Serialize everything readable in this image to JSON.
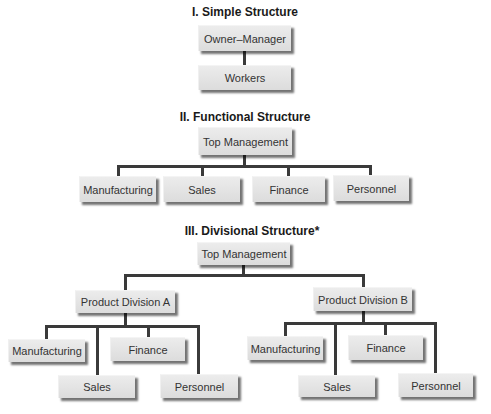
{
  "simple": {
    "title": "I. Simple Structure",
    "top": "Owner–Manager",
    "bottom": "Workers"
  },
  "functional": {
    "title": "II. Functional Structure",
    "top": "Top Management",
    "children": [
      "Manufacturing",
      "Sales",
      "Finance",
      "Personnel"
    ]
  },
  "divisional": {
    "title": "III. Divisional Structure*",
    "top": "Top Management",
    "division_a": {
      "label": "Product Division A",
      "children": [
        "Manufacturing",
        "Finance",
        "Sales",
        "Personnel"
      ]
    },
    "division_b": {
      "label": "Product Division B",
      "children": [
        "Manufacturing",
        "Finance",
        "Sales",
        "Personnel"
      ]
    }
  }
}
